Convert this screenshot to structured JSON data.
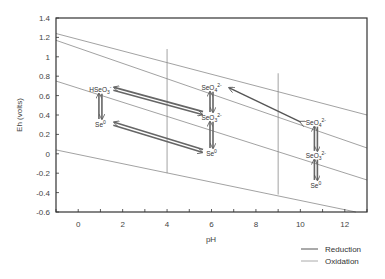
{
  "chart_data": {
    "type": "line",
    "title": "",
    "xlabel": "pH",
    "ylabel": "Eh (volts)",
    "xlim": [
      -1,
      13
    ],
    "ylim": [
      -0.6,
      1.4
    ],
    "xticks": [
      0,
      2,
      4,
      6,
      8,
      10,
      12
    ],
    "yticks": [
      -0.6,
      -0.4,
      -0.2,
      0,
      0.2,
      0.4,
      0.6,
      0.8,
      1,
      1.2,
      1.4
    ],
    "ytick_labels": [
      "-0.6",
      "-0.4",
      "-0.2",
      "0",
      "0.2",
      "0.4",
      "0.6",
      "0.8",
      "1",
      "1.2",
      "1.4"
    ],
    "grid": false,
    "boundary_lines": [
      {
        "name": "line-a",
        "x": [
          -1,
          13
        ],
        "y": [
          1.24,
          0.4
        ]
      },
      {
        "name": "line-b",
        "x": [
          -1,
          13
        ],
        "y": [
          1.17,
          0.06
        ]
      },
      {
        "name": "line-c",
        "x": [
          -1,
          13
        ],
        "y": [
          0.75,
          -0.27
        ]
      },
      {
        "name": "line-d",
        "x": [
          -1,
          12.5
        ],
        "y": [
          0.04,
          -0.6
        ]
      },
      {
        "name": "vertical-ph4",
        "x": [
          4,
          4
        ],
        "y": [
          1.08,
          -0.2
        ]
      },
      {
        "name": "vertical-ph9",
        "x": [
          9,
          9
        ],
        "y": [
          0.83,
          -0.42
        ]
      }
    ],
    "species": [
      {
        "label": "HSeO",
        "sub": "3",
        "sup": "-",
        "x": 1.0,
        "y": 0.66
      },
      {
        "label": "Se",
        "sub": "",
        "sup": "0",
        "x": 1.0,
        "y": 0.3
      },
      {
        "label": "SeO",
        "sub": "4",
        "sup": "2-",
        "x": 6.0,
        "y": 0.68
      },
      {
        "label": "SeO",
        "sub": "3",
        "sup": "2-",
        "x": 6.0,
        "y": 0.37
      },
      {
        "label": "Se",
        "sub": "",
        "sup": "0",
        "x": 6.0,
        "y": 0.0
      },
      {
        "label": "SeO",
        "sub": "4",
        "sup": "2-",
        "x": 10.7,
        "y": 0.32
      },
      {
        "label": "SeO",
        "sub": "3",
        "sup": "2-",
        "x": 10.7,
        "y": -0.02
      },
      {
        "label": "Se",
        "sub": "",
        "sup": "0",
        "x": 10.7,
        "y": -0.33
      }
    ],
    "arrows": [
      {
        "kind": "double-diagonal",
        "from": [
          1.6,
          0.67
        ],
        "to": [
          5.6,
          0.42
        ],
        "head": "both"
      },
      {
        "kind": "double-diagonal",
        "from": [
          1.6,
          0.31
        ],
        "to": [
          5.6,
          0.03
        ],
        "head": "both"
      },
      {
        "kind": "single-diagonal",
        "from": [
          10.0,
          0.33
        ],
        "to": [
          6.8,
          0.68
        ],
        "head": "both"
      },
      {
        "kind": "vertical-pair",
        "x": 1.0,
        "y": [
          0.62,
          0.36
        ]
      },
      {
        "kind": "vertical-pair",
        "x": 6.0,
        "y": [
          0.64,
          0.43
        ]
      },
      {
        "kind": "vertical-pair",
        "x": 6.0,
        "y": [
          0.33,
          0.06
        ]
      },
      {
        "kind": "vertical-pair",
        "x": 10.7,
        "y": [
          0.28,
          0.03
        ]
      },
      {
        "kind": "vertical-pair",
        "x": 10.7,
        "y": [
          -0.06,
          -0.27
        ]
      }
    ],
    "legend": {
      "position": "bottom-right",
      "entries": [
        {
          "label": "Reduction",
          "color": "#555555"
        },
        {
          "label": "Oxidation",
          "color": "#aaaaaa"
        }
      ]
    },
    "colors": {
      "axis": "#333333",
      "boundary": "#8a8a8a",
      "arrow": "#666666"
    }
  }
}
